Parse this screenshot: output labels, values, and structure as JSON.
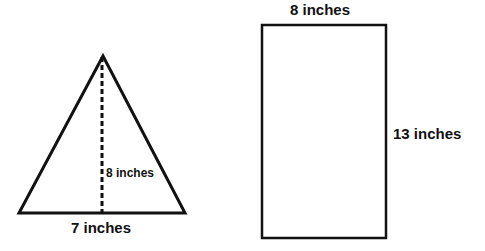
{
  "triangle": {
    "height_label": "8 inches",
    "base_label": "7 inches",
    "apex": [
      103,
      56
    ],
    "base_left": [
      19,
      213
    ],
    "base_right": [
      185,
      213
    ],
    "stroke_color": "#111111"
  },
  "rectangle": {
    "width_label": "8 inches",
    "height_label": "13 inches",
    "x": 262,
    "y": 25,
    "w": 124,
    "h": 213,
    "stroke_color": "#111111"
  }
}
